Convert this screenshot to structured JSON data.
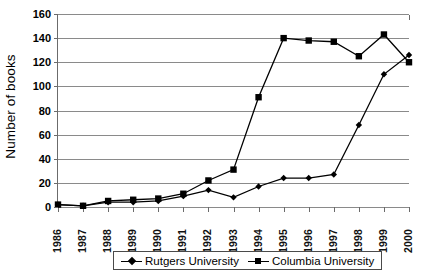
{
  "chart_data": {
    "type": "line",
    "title": "",
    "xlabel": "",
    "ylabel": "Number of books",
    "ylim": [
      0,
      160
    ],
    "yticks": [
      0,
      20,
      40,
      60,
      80,
      100,
      120,
      140,
      160
    ],
    "grid": true,
    "legend_position": "bottom",
    "categories": [
      "1986",
      "1987",
      "1988",
      "1989",
      "1990",
      "1991",
      "1992",
      "1993",
      "1994",
      "1995",
      "1996",
      "1997",
      "1998",
      "1999",
      "2000"
    ],
    "series": [
      {
        "name": "Rutgers University",
        "marker": "diamond",
        "values": [
          2,
          1,
          4,
          4,
          5,
          9,
          14,
          8,
          17,
          24,
          24,
          27,
          68,
          110,
          126
        ]
      },
      {
        "name": "Columbia University",
        "marker": "square",
        "values": [
          2,
          1,
          5,
          6,
          7,
          11,
          22,
          31,
          91,
          140,
          138,
          137,
          125,
          143,
          120
        ]
      }
    ]
  },
  "axis": {
    "y_title": "Number of books",
    "y_tick_labels": [
      "160",
      "140",
      "120",
      "100",
      "80",
      "60",
      "40",
      "20",
      "0"
    ],
    "x_tick_labels": [
      "1986",
      "1987",
      "1988",
      "1989",
      "1990",
      "1991",
      "1992",
      "1993",
      "1994",
      "1995",
      "1996",
      "1997",
      "1998",
      "1999",
      "2000"
    ]
  },
  "legend": {
    "items": [
      {
        "label": "Rutgers University",
        "marker": "diamond"
      },
      {
        "label": "Columbia University",
        "marker": "square"
      }
    ]
  },
  "colors": {
    "series": "#000000",
    "grid": "#8a8a8a",
    "axis": "#6b6b6b",
    "background": "#ffffff"
  }
}
